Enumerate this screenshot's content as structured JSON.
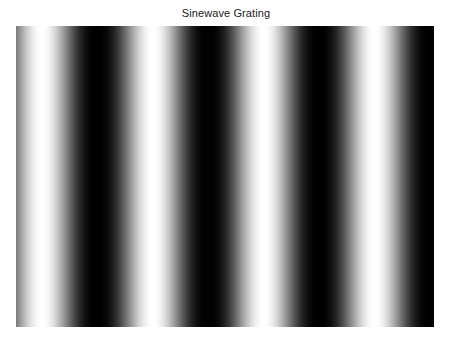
{
  "figure": {
    "title": "Sinewave Grating"
  },
  "chart_data": {
    "type": "heatmap",
    "title": "Sinewave Grating",
    "orientation": "vertical",
    "colormap": "gray",
    "cycles_across_width": 3.77,
    "phase_of_first_peak_fraction_of_period": 0.234,
    "intensity_range": [
      0,
      1
    ],
    "peaks": "bright",
    "xlabel": "",
    "ylabel": ""
  }
}
